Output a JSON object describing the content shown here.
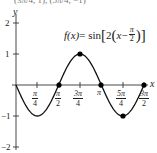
{
  "cropped_top_text": "(3π/4, 1), (5π/4, −1)",
  "function_label": {
    "lhs": "f(x)",
    "eq": " = sin",
    "inner_coef": "2",
    "x": "x",
    "minus": " − ",
    "frac_num": "π",
    "frac_den": "2"
  },
  "axes": {
    "x_label": "x",
    "y_label": "y"
  },
  "y_ticks": [
    "2",
    "1",
    "−1",
    "−2"
  ],
  "x_ticks": [
    {
      "num": "π",
      "den": "4"
    },
    {
      "num": "π",
      "den": "2"
    },
    {
      "num": "3π",
      "den": "4"
    },
    {
      "num": "π",
      "den": ""
    },
    {
      "num": "5π",
      "den": "4"
    },
    {
      "num": "3π",
      "den": "2"
    }
  ],
  "colors": {
    "curve": "#111111",
    "axis": "#333333",
    "points": "#000000"
  },
  "chart_data": {
    "type": "line",
    "xlabel": "x",
    "ylabel": "y",
    "x_tick_labels": [
      "π/4",
      "π/2",
      "3π/4",
      "π",
      "5π/4",
      "3π/2"
    ],
    "x_tick_values": [
      0.7854,
      1.5708,
      2.3562,
      3.1416,
      3.927,
      4.7124
    ],
    "y_tick_labels": [
      "−2",
      "−1",
      "1",
      "2"
    ],
    "y_tick_values": [
      -2,
      -1,
      1,
      2
    ],
    "xlim": [
      0,
      4.7124
    ],
    "ylim": [
      -2,
      2
    ],
    "grid": false,
    "series": [
      {
        "name": "f(x) = sin[2(x − π/2)]",
        "x": [
          0,
          0.3927,
          0.7854,
          1.1781,
          1.5708,
          1.9635,
          2.3562,
          2.7489,
          3.1416,
          3.5343,
          3.927,
          4.3197,
          4.7124
        ],
        "y": [
          0,
          -0.7071,
          -1,
          -0.7071,
          0,
          0.7071,
          1,
          0.7071,
          0,
          -0.7071,
          -1,
          -0.7071,
          0
        ]
      }
    ],
    "marked_points": [
      {
        "x_label": "π/2",
        "x": 1.5708,
        "y": 0
      },
      {
        "x_label": "3π/4",
        "x": 2.3562,
        "y": 1
      },
      {
        "x_label": "π",
        "x": 3.1416,
        "y": 0
      },
      {
        "x_label": "5π/4",
        "x": 3.927,
        "y": -1
      },
      {
        "x_label": "3π/2",
        "x": 4.7124,
        "y": 0
      }
    ]
  }
}
